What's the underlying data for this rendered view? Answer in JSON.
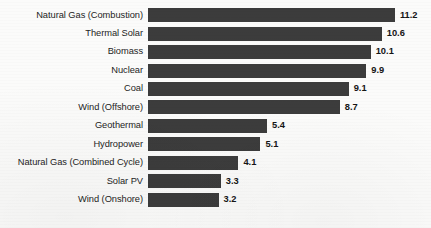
{
  "chart_data": {
    "type": "bar",
    "orientation": "horizontal",
    "title": "",
    "xlabel": "",
    "ylabel": "",
    "xlim": [
      0,
      12.4
    ],
    "grid": false,
    "legend": false,
    "bar_color": "#3c3c3c",
    "background_color": "#fbfbfa",
    "value_label_format": "one-decimal",
    "categories": [
      "Natural Gas (Combustion)",
      "Thermal Solar",
      "Biomass",
      "Nuclear",
      "Coal",
      "Wind (Offshore)",
      "Geothermal",
      "Hydropower",
      "Natural Gas (Combined Cycle)",
      "Solar PV",
      "Wind (Onshore)"
    ],
    "values": [
      11.2,
      10.6,
      10.1,
      9.9,
      9.1,
      8.7,
      5.4,
      5.1,
      4.1,
      3.3,
      3.2
    ],
    "value_labels": [
      "11.2",
      "10.6",
      "10.1",
      "9.9",
      "9.1",
      "8.7",
      "5.4",
      "5.1",
      "4.1",
      "3.3",
      "3.2"
    ]
  }
}
